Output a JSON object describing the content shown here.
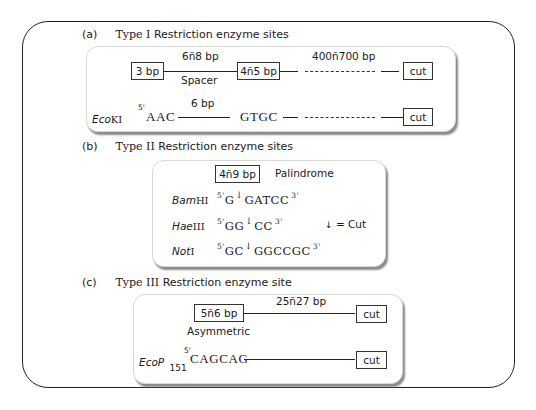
{
  "sections": {
    "a": {
      "tag": "(a)",
      "title_roman": "Type I",
      "title_rest": "Restriction enzyme sites",
      "box_left": "3 bp",
      "spacer_top": "6ñ8 bp",
      "spacer_bottom": "Spacer",
      "box_mid": "4ñ5 bp",
      "distance": "400ñ700 bp",
      "cut_top": "cut",
      "enzyme_italic": "Eco",
      "enzyme_roman": "KI",
      "prime5": "5'",
      "seq_left": "AAC",
      "gap": "6 bp",
      "seq_right": "GTGC",
      "cut_bottom": "cut"
    },
    "b": {
      "tag": "(b)",
      "title_roman": "Type II",
      "title_rest": "Restriction enzyme sites",
      "box": "4ñ9 bp",
      "palindrome": "Palindrome",
      "legend_arrow": "↓",
      "legend_text": "= Cut",
      "enzymes": [
        {
          "italic": "Bam",
          "roman": "HI",
          "p5": "5'",
          "before": "G",
          "after": "GATCC",
          "p3": "3'"
        },
        {
          "italic": "Hae",
          "roman": "III",
          "p5": "5'",
          "before": "GG",
          "after": "CC",
          "p3": "3'"
        },
        {
          "italic": "Not",
          "roman": "I",
          "p5": "5'",
          "before": "GC",
          "after": "GGCCGC",
          "p3": "3'"
        }
      ]
    },
    "c": {
      "tag": "(c)",
      "title_roman": "Type III",
      "title_rest": "Restriction enzyme site",
      "box": "5ñ6 bp",
      "asymmetric": "Asymmetric",
      "distance": "25ñ27 bp",
      "cut_top": "cut",
      "enzyme_italic": "EcoP",
      "enzyme_sub": "151",
      "prime5": "5'",
      "seq": "CAGCAG",
      "cut_bottom": "cut"
    }
  }
}
